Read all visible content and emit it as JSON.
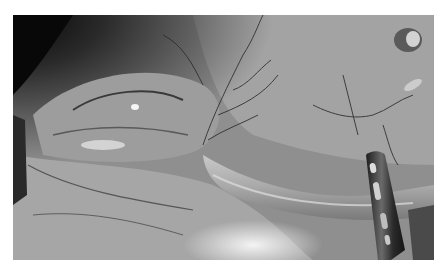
{
  "image": {
    "description": "Grayscale laparoscopic surgical photograph showing tissue with blood vessels, a tubular structure, and a fenestrated metal grasper instrument at lower right",
    "colors": {
      "background": "#ffffff",
      "tissue_mid": "#9a9a9a",
      "tissue_light": "#d8d8d8",
      "shadow": "#1a1a1a",
      "instrument": "#3a3a3a"
    }
  }
}
